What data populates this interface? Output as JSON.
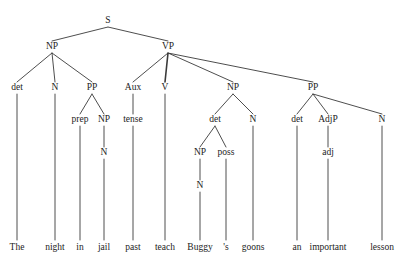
{
  "diagram": {
    "type": "constituency-syntax-tree",
    "sentence": "The night in jail past teach Buggy 's goons an important lesson",
    "line_color": "#3a3a3a",
    "text_color": "#1c1c1c",
    "background_color": "#ffffff",
    "nodes": [
      {
        "id": "S",
        "label": "S",
        "x": 108,
        "y": 21
      },
      {
        "id": "NP1",
        "label": "NP",
        "x": 52,
        "y": 47
      },
      {
        "id": "VP",
        "label": "VP",
        "x": 168,
        "y": 47
      },
      {
        "id": "det1",
        "label": "det",
        "x": 17,
        "y": 88
      },
      {
        "id": "N1",
        "label": "N",
        "x": 55,
        "y": 88
      },
      {
        "id": "PP1",
        "label": "PP",
        "x": 92,
        "y": 88
      },
      {
        "id": "Aux",
        "label": "Aux",
        "x": 133,
        "y": 88
      },
      {
        "id": "V",
        "label": "V",
        "x": 165,
        "y": 88
      },
      {
        "id": "NP2",
        "label": "NP",
        "x": 233,
        "y": 88
      },
      {
        "id": "PP2",
        "label": "PP",
        "x": 313,
        "y": 88
      },
      {
        "id": "prep",
        "label": "prep",
        "x": 80,
        "y": 120
      },
      {
        "id": "NP3",
        "label": "NP",
        "x": 104,
        "y": 120
      },
      {
        "id": "tense",
        "label": "tense",
        "x": 133,
        "y": 120
      },
      {
        "id": "det2",
        "label": "det",
        "x": 215,
        "y": 120
      },
      {
        "id": "N2",
        "label": "N",
        "x": 253,
        "y": 120
      },
      {
        "id": "det3",
        "label": "det",
        "x": 297,
        "y": 120
      },
      {
        "id": "AdjP",
        "label": "AdjP",
        "x": 328,
        "y": 120
      },
      {
        "id": "N3",
        "label": "N",
        "x": 382,
        "y": 120
      },
      {
        "id": "N4",
        "label": "N",
        "x": 104,
        "y": 153
      },
      {
        "id": "NP4",
        "label": "NP",
        "x": 200,
        "y": 153
      },
      {
        "id": "poss",
        "label": "poss",
        "x": 226,
        "y": 153
      },
      {
        "id": "adj",
        "label": "adj",
        "x": 328,
        "y": 153
      },
      {
        "id": "N5",
        "label": "N",
        "x": 200,
        "y": 186
      }
    ],
    "words": [
      {
        "id": "w-the",
        "label": "The",
        "x": 17,
        "y": 248
      },
      {
        "id": "w-night",
        "label": "night",
        "x": 55,
        "y": 248
      },
      {
        "id": "w-in",
        "label": "in",
        "x": 80,
        "y": 248
      },
      {
        "id": "w-jail",
        "label": "jail",
        "x": 104,
        "y": 248
      },
      {
        "id": "w-past",
        "label": "past",
        "x": 133,
        "y": 248
      },
      {
        "id": "w-teach",
        "label": "teach",
        "x": 165,
        "y": 248
      },
      {
        "id": "w-buggy",
        "label": "Buggy",
        "x": 200,
        "y": 248
      },
      {
        "id": "w-poss",
        "label": "'s",
        "x": 226,
        "y": 248
      },
      {
        "id": "w-goons",
        "label": "goons",
        "x": 253,
        "y": 248
      },
      {
        "id": "w-an",
        "label": "an",
        "x": 297,
        "y": 248
      },
      {
        "id": "w-important",
        "label": "important",
        "x": 328,
        "y": 248
      },
      {
        "id": "w-lesson",
        "label": "lesson",
        "x": 382,
        "y": 248
      }
    ],
    "edges": [
      {
        "from": "S",
        "to": "NP1",
        "x1": 108,
        "y1": 27,
        "x2": 52,
        "y2": 41,
        "w": 0.9
      },
      {
        "from": "S",
        "to": "VP",
        "x1": 108,
        "y1": 27,
        "x2": 168,
        "y2": 41,
        "w": 0.9
      },
      {
        "from": "NP1",
        "to": "det1",
        "x1": 52,
        "y1": 53,
        "x2": 17,
        "y2": 82,
        "w": 0.9
      },
      {
        "from": "NP1",
        "to": "N1",
        "x1": 52,
        "y1": 53,
        "x2": 55,
        "y2": 82,
        "w": 0.9
      },
      {
        "from": "NP1",
        "to": "PP1",
        "x1": 52,
        "y1": 53,
        "x2": 92,
        "y2": 82,
        "w": 0.9
      },
      {
        "from": "VP",
        "to": "Aux",
        "x1": 168,
        "y1": 53,
        "x2": 133,
        "y2": 82,
        "w": 0.9
      },
      {
        "from": "VP",
        "to": "V",
        "x1": 168,
        "y1": 53,
        "x2": 165,
        "y2": 82,
        "w": 1.6
      },
      {
        "from": "VP",
        "to": "NP2",
        "x1": 168,
        "y1": 53,
        "x2": 233,
        "y2": 82,
        "w": 0.9
      },
      {
        "from": "VP",
        "to": "PP2",
        "x1": 168,
        "y1": 53,
        "x2": 313,
        "y2": 82,
        "w": 0.9
      },
      {
        "from": "PP1",
        "to": "prep",
        "x1": 92,
        "y1": 94,
        "x2": 80,
        "y2": 114,
        "w": 0.9
      },
      {
        "from": "PP1",
        "to": "NP3",
        "x1": 92,
        "y1": 94,
        "x2": 104,
        "y2": 114,
        "w": 0.9
      },
      {
        "from": "Aux",
        "to": "tense",
        "x1": 133,
        "y1": 94,
        "x2": 133,
        "y2": 114,
        "w": 0.9
      },
      {
        "from": "NP2",
        "to": "det2",
        "x1": 233,
        "y1": 94,
        "x2": 215,
        "y2": 114,
        "w": 0.9
      },
      {
        "from": "NP2",
        "to": "N2",
        "x1": 233,
        "y1": 94,
        "x2": 253,
        "y2": 114,
        "w": 0.9
      },
      {
        "from": "PP2",
        "to": "det3",
        "x1": 313,
        "y1": 94,
        "x2": 297,
        "y2": 114,
        "w": 0.9
      },
      {
        "from": "PP2",
        "to": "AdjP",
        "x1": 313,
        "y1": 94,
        "x2": 328,
        "y2": 114,
        "w": 0.9
      },
      {
        "from": "PP2",
        "to": "N3",
        "x1": 313,
        "y1": 94,
        "x2": 382,
        "y2": 114,
        "w": 0.9
      },
      {
        "from": "NP3",
        "to": "N4",
        "x1": 104,
        "y1": 126,
        "x2": 104,
        "y2": 147,
        "w": 0.9
      },
      {
        "from": "det2",
        "to": "NP4",
        "x1": 215,
        "y1": 126,
        "x2": 200,
        "y2": 147,
        "w": 0.9
      },
      {
        "from": "det2",
        "to": "poss",
        "x1": 215,
        "y1": 126,
        "x2": 226,
        "y2": 147,
        "w": 0.9
      },
      {
        "from": "AdjP",
        "to": "adj",
        "x1": 328,
        "y1": 126,
        "x2": 328,
        "y2": 147,
        "w": 0.9
      },
      {
        "from": "NP4",
        "to": "N5",
        "x1": 200,
        "y1": 159,
        "x2": 200,
        "y2": 180,
        "w": 0.9
      },
      {
        "from": "det1",
        "to": "w-the",
        "x1": 17,
        "y1": 94,
        "x2": 17,
        "y2": 240,
        "w": 0.9
      },
      {
        "from": "N1",
        "to": "w-night",
        "x1": 55,
        "y1": 94,
        "x2": 55,
        "y2": 240,
        "w": 0.9
      },
      {
        "from": "prep",
        "to": "w-in",
        "x1": 80,
        "y1": 126,
        "x2": 80,
        "y2": 240,
        "w": 0.9
      },
      {
        "from": "N4",
        "to": "w-jail",
        "x1": 104,
        "y1": 159,
        "x2": 104,
        "y2": 240,
        "w": 0.9
      },
      {
        "from": "tense",
        "to": "w-past",
        "x1": 133,
        "y1": 126,
        "x2": 133,
        "y2": 240,
        "w": 0.9
      },
      {
        "from": "V",
        "to": "w-teach",
        "x1": 165,
        "y1": 94,
        "x2": 165,
        "y2": 240,
        "w": 0.9
      },
      {
        "from": "N5",
        "to": "w-buggy",
        "x1": 200,
        "y1": 192,
        "x2": 200,
        "y2": 240,
        "w": 0.9
      },
      {
        "from": "poss",
        "to": "w-poss",
        "x1": 226,
        "y1": 159,
        "x2": 226,
        "y2": 240,
        "w": 0.9
      },
      {
        "from": "N2",
        "to": "w-goons",
        "x1": 253,
        "y1": 126,
        "x2": 253,
        "y2": 240,
        "w": 0.9
      },
      {
        "from": "det3",
        "to": "w-an",
        "x1": 297,
        "y1": 126,
        "x2": 297,
        "y2": 240,
        "w": 0.9
      },
      {
        "from": "adj",
        "to": "w-important",
        "x1": 328,
        "y1": 159,
        "x2": 328,
        "y2": 240,
        "w": 0.9
      },
      {
        "from": "N3",
        "to": "w-lesson",
        "x1": 382,
        "y1": 126,
        "x2": 382,
        "y2": 240,
        "w": 0.9
      }
    ]
  }
}
